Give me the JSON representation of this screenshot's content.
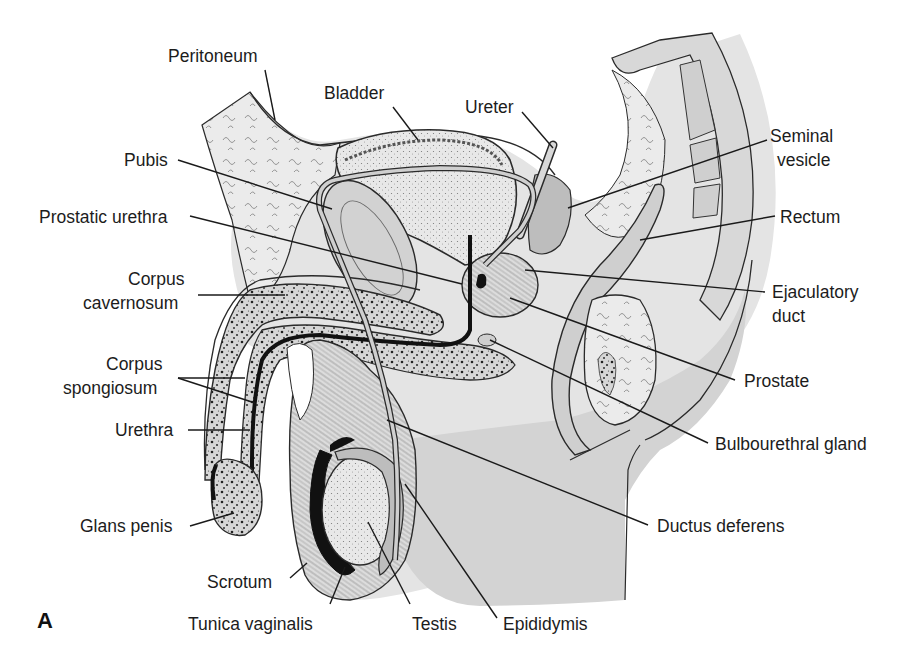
{
  "figure": {
    "panel_letter": "A",
    "colors": {
      "background": "#ffffff",
      "tissue_light": "#e6e6e6",
      "tissue_mid": "#d2d2d2",
      "tissue_dark": "#bdbdbd",
      "outline": "#2a2a2a",
      "dark_fill": "#111111",
      "label_text": "#1c1c1c"
    }
  },
  "labels": {
    "peritoneum": "Peritoneum",
    "bladder": "Bladder",
    "ureter": "Ureter",
    "seminal_vesicle_1": "Seminal",
    "seminal_vesicle_2": "vesicle",
    "pubis": "Pubis",
    "prostatic_urethra": "Prostatic urethra",
    "rectum": "Rectum",
    "corpus_cavernosum_1": "Corpus",
    "corpus_cavernosum_2": "cavernosum",
    "ejaculatory_duct_1": "Ejaculatory",
    "ejaculatory_duct_2": "duct",
    "corpus_spongiosum_1": "Corpus",
    "corpus_spongiosum_2": "spongiosum",
    "prostate": "Prostate",
    "urethra": "Urethra",
    "bulbourethral_gland": "Bulbourethral gland",
    "glans_penis": "Glans penis",
    "ductus_deferens": "Ductus deferens",
    "scrotum": "Scrotum",
    "tunica_vaginalis": "Tunica vaginalis",
    "testis": "Testis",
    "epididymis": "Epididymis"
  },
  "leader_lines": [
    {
      "name": "peritoneum",
      "x1": 265,
      "y1": 70,
      "x2": 275,
      "y2": 120
    },
    {
      "name": "bladder",
      "x1": 393,
      "y1": 107,
      "x2": 418,
      "y2": 140
    },
    {
      "name": "ureter",
      "x1": 522,
      "y1": 112,
      "x2": 553,
      "y2": 148
    },
    {
      "name": "seminal-vesicle",
      "x1": 767,
      "y1": 140,
      "x2": 568,
      "y2": 208
    },
    {
      "name": "pubis",
      "x1": 178,
      "y1": 160,
      "x2": 332,
      "y2": 209
    },
    {
      "name": "prostatic-urethra",
      "x1": 190,
      "y1": 216,
      "x2": 462,
      "y2": 284
    },
    {
      "name": "rectum",
      "x1": 775,
      "y1": 216,
      "x2": 640,
      "y2": 240
    },
    {
      "name": "corpus-cavernosum",
      "x1": 198,
      "y1": 295,
      "x2": 285,
      "y2": 295
    },
    {
      "name": "ejaculatory-duct",
      "x1": 765,
      "y1": 292,
      "x2": 525,
      "y2": 270
    },
    {
      "name": "corpus-spongiosum-a",
      "x1": 178,
      "y1": 378,
      "x2": 245,
      "y2": 378
    },
    {
      "name": "corpus-spongiosum-b",
      "x1": 178,
      "y1": 378,
      "x2": 255,
      "y2": 403
    },
    {
      "name": "prostate",
      "x1": 735,
      "y1": 380,
      "x2": 510,
      "y2": 298
    },
    {
      "name": "urethra",
      "x1": 188,
      "y1": 430,
      "x2": 250,
      "y2": 430
    },
    {
      "name": "bulbourethral-gland",
      "x1": 708,
      "y1": 443,
      "x2": 490,
      "y2": 340
    },
    {
      "name": "glans-penis",
      "x1": 190,
      "y1": 526,
      "x2": 234,
      "y2": 513
    },
    {
      "name": "ductus-deferens",
      "x1": 648,
      "y1": 525,
      "x2": 387,
      "y2": 420
    },
    {
      "name": "scrotum",
      "x1": 290,
      "y1": 578,
      "x2": 307,
      "y2": 563
    },
    {
      "name": "tunica-vaginalis",
      "x1": 330,
      "y1": 604,
      "x2": 345,
      "y2": 567
    },
    {
      "name": "testis",
      "x1": 410,
      "y1": 604,
      "x2": 368,
      "y2": 522
    },
    {
      "name": "epididymis",
      "x1": 497,
      "y1": 618,
      "x2": 405,
      "y2": 484
    }
  ],
  "label_positions": [
    {
      "key": "peritoneum",
      "x": 168,
      "y": 44,
      "align": "left"
    },
    {
      "key": "bladder",
      "x": 324,
      "y": 81,
      "align": "left"
    },
    {
      "key": "ureter",
      "x": 465,
      "y": 95,
      "align": "left"
    },
    {
      "key": "seminal_vesicle_1",
      "x": 770,
      "y": 124,
      "align": "left"
    },
    {
      "key": "seminal_vesicle_2",
      "x": 777,
      "y": 148,
      "align": "left"
    },
    {
      "key": "pubis",
      "x": 124,
      "y": 148,
      "align": "left"
    },
    {
      "key": "prostatic_urethra",
      "x": 39,
      "y": 205,
      "align": "left"
    },
    {
      "key": "rectum",
      "x": 780,
      "y": 205,
      "align": "left"
    },
    {
      "key": "corpus_cavernosum_1",
      "x": 128,
      "y": 267,
      "align": "left"
    },
    {
      "key": "corpus_cavernosum_2",
      "x": 83,
      "y": 291,
      "align": "left"
    },
    {
      "key": "ejaculatory_duct_1",
      "x": 772,
      "y": 280,
      "align": "left"
    },
    {
      "key": "ejaculatory_duct_2",
      "x": 772,
      "y": 304,
      "align": "left"
    },
    {
      "key": "corpus_spongiosum_1",
      "x": 106,
      "y": 352,
      "align": "left"
    },
    {
      "key": "corpus_spongiosum_2",
      "x": 63,
      "y": 376,
      "align": "left"
    },
    {
      "key": "prostate",
      "x": 744,
      "y": 369,
      "align": "left"
    },
    {
      "key": "urethra",
      "x": 115,
      "y": 418,
      "align": "left"
    },
    {
      "key": "bulbourethral_gland",
      "x": 715,
      "y": 432,
      "align": "left"
    },
    {
      "key": "glans_penis",
      "x": 80,
      "y": 514,
      "align": "left"
    },
    {
      "key": "ductus_deferens",
      "x": 657,
      "y": 514,
      "align": "left"
    },
    {
      "key": "scrotum",
      "x": 207,
      "y": 570,
      "align": "left"
    },
    {
      "key": "tunica_vaginalis",
      "x": 188,
      "y": 612,
      "align": "left"
    },
    {
      "key": "testis",
      "x": 412,
      "y": 612,
      "align": "left"
    },
    {
      "key": "epididymis",
      "x": 503,
      "y": 612,
      "align": "left"
    }
  ]
}
